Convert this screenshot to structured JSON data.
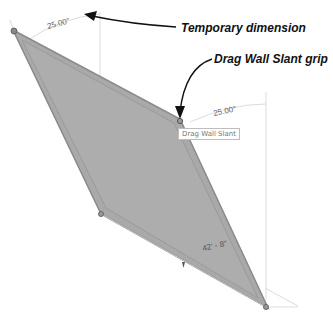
{
  "diagram": {
    "callouts": {
      "temporary_dimension": "Temporary dimension",
      "drag_wall_slant_grip": "Drag Wall Slant grip"
    },
    "tooltip": "Drag Wall Slant",
    "dimensions": {
      "top_angle": "25.00°",
      "right_angle": "25.00°",
      "wall_length": "42' - 8\""
    },
    "colors": {
      "wall_fill": "#a9a9a9",
      "wall_edge": "#8a8a8a",
      "guide_line": "#d8d8d8",
      "arrow": "#111111"
    }
  }
}
